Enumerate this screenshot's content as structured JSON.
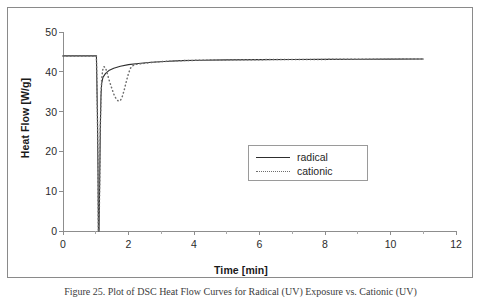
{
  "figure": {
    "caption": "Figure 25. Plot of DSC Heat Flow Curves for Radical (UV) Exposure vs. Cationic (UV)"
  },
  "chart_data": {
    "type": "line",
    "title": "",
    "xlabel": "Time [min]",
    "ylabel": "Heat Flow [W/g]",
    "xlim": [
      0,
      12
    ],
    "ylim": [
      0,
      50
    ],
    "xticks": [
      0,
      2,
      4,
      6,
      8,
      10,
      12
    ],
    "xticks_minor": [
      1,
      3,
      5,
      7,
      9,
      11
    ],
    "yticks": [
      0,
      10,
      20,
      30,
      40,
      50
    ],
    "grid": false,
    "legend_position": "center-right",
    "series": [
      {
        "name": "radical",
        "style": "solid",
        "color": "#2e2e2e",
        "points": [
          [
            0.0,
            44.0
          ],
          [
            0.2,
            44.0
          ],
          [
            0.4,
            44.0
          ],
          [
            0.6,
            44.0
          ],
          [
            0.8,
            44.0
          ],
          [
            0.95,
            44.0
          ],
          [
            1.02,
            44.0
          ],
          [
            1.05,
            30.0
          ],
          [
            1.07,
            14.0
          ],
          [
            1.08,
            0.2
          ],
          [
            1.09,
            0.0
          ],
          [
            1.1,
            0.0
          ],
          [
            1.12,
            12.0
          ],
          [
            1.14,
            26.0
          ],
          [
            1.16,
            34.0
          ],
          [
            1.18,
            37.0
          ],
          [
            1.22,
            38.6
          ],
          [
            1.3,
            39.6
          ],
          [
            1.4,
            40.3
          ],
          [
            1.55,
            40.9
          ],
          [
            1.75,
            41.4
          ],
          [
            2.0,
            41.8
          ],
          [
            2.3,
            42.1
          ],
          [
            2.7,
            42.4
          ],
          [
            3.1,
            42.6
          ],
          [
            3.6,
            42.8
          ],
          [
            4.2,
            42.9
          ],
          [
            5.0,
            43.0
          ],
          [
            6.0,
            43.05
          ],
          [
            7.0,
            43.1
          ],
          [
            8.0,
            43.12
          ],
          [
            9.0,
            43.15
          ],
          [
            10.0,
            43.18
          ],
          [
            11.0,
            43.2
          ]
        ]
      },
      {
        "name": "cationic",
        "style": "dotted",
        "color": "#6e6e6e",
        "points": [
          [
            0.0,
            44.0
          ],
          [
            0.4,
            44.0
          ],
          [
            0.8,
            44.0
          ],
          [
            1.02,
            44.0
          ],
          [
            1.05,
            30.0
          ],
          [
            1.07,
            14.0
          ],
          [
            1.08,
            0.2
          ],
          [
            1.09,
            0.0
          ],
          [
            1.1,
            0.0
          ],
          [
            1.12,
            12.0
          ],
          [
            1.14,
            26.0
          ],
          [
            1.16,
            34.0
          ],
          [
            1.18,
            38.0
          ],
          [
            1.21,
            40.4
          ],
          [
            1.25,
            41.3
          ],
          [
            1.3,
            41.0
          ],
          [
            1.35,
            39.6
          ],
          [
            1.42,
            37.6
          ],
          [
            1.5,
            35.6
          ],
          [
            1.57,
            34.0
          ],
          [
            1.64,
            33.0
          ],
          [
            1.7,
            32.6
          ],
          [
            1.76,
            32.9
          ],
          [
            1.82,
            34.0
          ],
          [
            1.88,
            35.8
          ],
          [
            1.94,
            37.8
          ],
          [
            2.0,
            39.6
          ],
          [
            2.06,
            40.9
          ],
          [
            2.12,
            41.5
          ],
          [
            2.25,
            41.9
          ],
          [
            2.45,
            42.1
          ],
          [
            2.75,
            42.4
          ],
          [
            3.1,
            42.6
          ],
          [
            3.6,
            42.8
          ],
          [
            4.2,
            42.9
          ],
          [
            5.0,
            43.0
          ],
          [
            6.0,
            43.05
          ],
          [
            7.0,
            43.1
          ],
          [
            8.0,
            43.12
          ],
          [
            9.0,
            43.15
          ],
          [
            10.0,
            43.18
          ],
          [
            11.0,
            43.2
          ]
        ]
      }
    ],
    "legend": [
      {
        "label": "radical",
        "style": "solid"
      },
      {
        "label": "cationic",
        "style": "dotted"
      }
    ]
  }
}
